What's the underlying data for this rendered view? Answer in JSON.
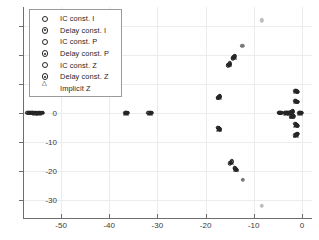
{
  "chart_data": {
    "type": "scatter",
    "title": "",
    "xlabel": "",
    "ylabel": "",
    "xlim": [
      -57.9,
      2.1
    ],
    "ylim": [
      -36.4,
      36.6
    ],
    "grid": true,
    "legend_position": "top-left",
    "xticks": [
      -50,
      -40,
      -30,
      -20,
      -10,
      0
    ],
    "xtick_labels": [
      "-50",
      "-40",
      "-30",
      "-20",
      "-10",
      "0"
    ],
    "yticks": [
      30,
      20,
      10,
      0,
      -10,
      -20,
      -30
    ],
    "ytick_labels": [
      "30",
      "20",
      "10",
      "0",
      "-10",
      "-20",
      "-30"
    ],
    "series": [
      {
        "name": "IC const. I",
        "marker": "circle-open",
        "points": [
          [
            -56.8,
            0.0
          ],
          [
            -55.4,
            0.0
          ],
          [
            -54.6,
            0.0
          ],
          [
            -36.4,
            0.0
          ],
          [
            -31.6,
            0.0
          ],
          [
            -17.3,
            5.4
          ],
          [
            -17.3,
            -5.4
          ],
          [
            -15.0,
            16.9
          ],
          [
            -14.2,
            19.2
          ],
          [
            -14.6,
            -17.0
          ],
          [
            -13.8,
            -19.4
          ],
          [
            -4.6,
            0.0
          ],
          [
            -3.4,
            0.0
          ],
          [
            -2.9,
            0.0
          ],
          [
            -2.2,
            0.2
          ],
          [
            -2.0,
            -1.0
          ],
          [
            -1.2,
            7.5
          ],
          [
            -1.2,
            4.0
          ],
          [
            -1.2,
            -4.1
          ],
          [
            -1.2,
            -7.6
          ],
          [
            -0.4,
            0.0
          ]
        ]
      },
      {
        "name": "Delay const. I",
        "marker": "circle-dot",
        "points": [
          [
            -56.6,
            0.0
          ],
          [
            -55.2,
            0.0
          ],
          [
            -54.4,
            0.0
          ],
          [
            -36.5,
            0.0
          ],
          [
            -31.4,
            0.0
          ],
          [
            -17.2,
            5.6
          ],
          [
            -17.2,
            -5.6
          ],
          [
            -15.1,
            16.7
          ],
          [
            -14.1,
            19.4
          ],
          [
            -14.7,
            -17.2
          ],
          [
            -13.7,
            -19.6
          ],
          [
            -4.5,
            0.0
          ],
          [
            -3.3,
            0.0
          ],
          [
            -2.8,
            0.0
          ],
          [
            -2.1,
            0.3
          ],
          [
            -1.9,
            -1.1
          ],
          [
            -1.1,
            7.4
          ],
          [
            -1.1,
            3.9
          ],
          [
            -1.1,
            -4.2
          ],
          [
            -1.1,
            -7.5
          ],
          [
            -0.3,
            0.0
          ]
        ]
      },
      {
        "name": "IC const. P",
        "marker": "circle-open",
        "points": [
          [
            -57.0,
            0.0
          ],
          [
            -55.6,
            0.0
          ],
          [
            -54.8,
            0.0
          ],
          [
            -36.6,
            0.0
          ],
          [
            -31.8,
            0.0
          ],
          [
            -17.4,
            5.3
          ],
          [
            -17.4,
            -5.3
          ],
          [
            -14.9,
            17.1
          ],
          [
            -14.3,
            19.0
          ],
          [
            -14.5,
            -16.8
          ],
          [
            -13.9,
            -19.2
          ],
          [
            -4.7,
            0.0
          ],
          [
            -3.5,
            0.0
          ],
          [
            -3.0,
            0.0
          ],
          [
            -2.3,
            0.1
          ],
          [
            -2.1,
            -0.9
          ],
          [
            -1.3,
            7.6
          ],
          [
            -1.3,
            4.1
          ],
          [
            -1.3,
            -4.0
          ],
          [
            -1.3,
            -7.7
          ],
          [
            -0.5,
            0.0
          ]
        ]
      },
      {
        "name": "Delay const. P",
        "marker": "circle-dot",
        "points": [
          [
            -56.4,
            0.0
          ],
          [
            -55.0,
            0.0
          ],
          [
            -54.2,
            0.0
          ],
          [
            -36.3,
            0.0
          ],
          [
            -31.3,
            0.0
          ],
          [
            -17.1,
            5.5
          ],
          [
            -17.1,
            -5.5
          ],
          [
            -15.2,
            16.6
          ],
          [
            -14.0,
            19.5
          ],
          [
            -14.8,
            -17.3
          ],
          [
            -13.6,
            -19.7
          ],
          [
            -4.4,
            0.0
          ],
          [
            -3.2,
            0.0
          ],
          [
            -2.7,
            0.0
          ],
          [
            -2.0,
            0.4
          ],
          [
            -1.8,
            -1.2
          ],
          [
            -1.0,
            7.3
          ],
          [
            -1.0,
            3.8
          ],
          [
            -1.0,
            -4.3
          ],
          [
            -1.0,
            -7.4
          ],
          [
            -0.2,
            0.0
          ]
        ]
      },
      {
        "name": "IC const. Z",
        "marker": "circle-open",
        "points": [
          [
            -56.2,
            0.0
          ],
          [
            -55.8,
            0.0
          ],
          [
            -54.0,
            0.0
          ],
          [
            -36.7,
            0.0
          ],
          [
            -31.9,
            0.0
          ],
          [
            -17.5,
            5.2
          ],
          [
            -17.5,
            -5.2
          ],
          [
            -15.3,
            16.4
          ],
          [
            -14.4,
            18.8
          ],
          [
            -14.9,
            -17.5
          ],
          [
            -14.0,
            -19.0
          ],
          [
            -4.8,
            0.0
          ],
          [
            -3.6,
            0.0
          ],
          [
            -3.1,
            0.0
          ],
          [
            -2.4,
            0.0
          ],
          [
            -2.2,
            -1.3
          ],
          [
            -1.4,
            7.7
          ],
          [
            -1.4,
            4.2
          ],
          [
            -1.4,
            -3.9
          ],
          [
            -1.4,
            -7.8
          ],
          [
            -0.6,
            0.0
          ]
        ]
      },
      {
        "name": "Delay const. Z",
        "marker": "circle-dot",
        "points": [
          [
            -56.0,
            0.0
          ],
          [
            -55.9,
            0.0
          ],
          [
            -53.8,
            0.0
          ],
          [
            -36.2,
            0.0
          ],
          [
            -31.2,
            0.0
          ],
          [
            -17.0,
            5.7
          ],
          [
            -17.0,
            -5.7
          ],
          [
            -12.4,
            23.2
          ],
          [
            -12.2,
            -23.2
          ],
          [
            -8.3,
            32.0
          ],
          [
            -8.3,
            -32.2
          ],
          [
            -4.3,
            0.0
          ],
          [
            -3.1,
            0.0
          ],
          [
            -2.6,
            0.0
          ],
          [
            -1.9,
            0.5
          ],
          [
            -0.9,
            7.2
          ],
          [
            -0.9,
            3.7
          ],
          [
            -0.9,
            -4.4
          ],
          [
            -0.9,
            -7.3
          ],
          [
            -0.1,
            0.0
          ]
        ]
      },
      {
        "name": "Implicit Z",
        "marker": "triangle-open",
        "points": [
          [
            -55.5,
            0.0
          ],
          [
            -54.5,
            0.0
          ],
          [
            -36.45,
            0.0
          ],
          [
            -31.5,
            0.0
          ],
          [
            -17.25,
            5.45
          ],
          [
            -17.25,
            -5.45
          ],
          [
            -15.05,
            16.8
          ],
          [
            -14.15,
            19.3
          ],
          [
            -14.65,
            -17.1
          ],
          [
            -13.75,
            -19.5
          ],
          [
            -3.4,
            0.0
          ],
          [
            -2.5,
            0.0
          ],
          [
            -2.0,
            -1.05
          ],
          [
            -1.15,
            7.45
          ],
          [
            -1.15,
            3.95
          ],
          [
            -1.15,
            -4.15
          ],
          [
            -1.15,
            -7.55
          ],
          [
            -0.35,
            0.0
          ]
        ]
      }
    ]
  },
  "legend": {
    "items": [
      {
        "label": "IC const. I",
        "key": "circle-open"
      },
      {
        "label": "Delay const. I",
        "key": "circle-dot"
      },
      {
        "label": "IC const. P",
        "key": "circle-open"
      },
      {
        "label": "Delay const. P",
        "key": "circle-dot"
      },
      {
        "label": "IC const. Z",
        "key": "circle-open"
      },
      {
        "label": "Delay const. Z",
        "key": "circle-dot"
      },
      {
        "label": "Implicit Z",
        "key": "triangle-open"
      }
    ]
  },
  "colors": {
    "marker": "#262626",
    "axis": "#6e6e6e",
    "grid": "#ececec",
    "background": "#ffffff",
    "tick_label": "#3a3a3a"
  }
}
